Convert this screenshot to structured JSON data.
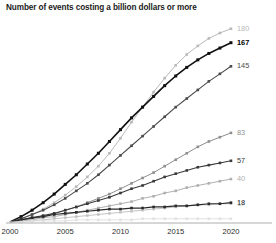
{
  "chart_data": {
    "type": "line",
    "title": "Number of events costing a billion dollars or more",
    "xlabel": "",
    "ylabel": "",
    "xlim": [
      2000,
      2021
    ],
    "ylim": [
      0,
      190
    ],
    "grid": false,
    "legend": "end-of-line labels",
    "x": [
      2000,
      2001,
      2002,
      2003,
      2004,
      2005,
      2006,
      2007,
      2008,
      2009,
      2010,
      2011,
      2012,
      2013,
      2014,
      2015,
      2016,
      2017,
      2018,
      2019,
      2020
    ],
    "xtick_labels": [
      "2000",
      "2005",
      "2010",
      "2015",
      "2020"
    ],
    "xticks": [
      2000,
      2005,
      2010,
      2015,
      2020
    ],
    "series": [
      {
        "name": "180",
        "end_label": "180",
        "end_value": 180,
        "color": "#b9b9b9",
        "line_width": 1.0,
        "marker": "square",
        "emphasis": false,
        "values": [
          0,
          3,
          7,
          12,
          18,
          25,
          33,
          42,
          52,
          64,
          78,
          93,
          107,
          121,
          134,
          146,
          156,
          164,
          171,
          176,
          180
        ]
      },
      {
        "name": "167",
        "end_label": "167",
        "end_value": 167,
        "color": "#111111",
        "line_width": 1.6,
        "marker": "square",
        "emphasis": true,
        "values": [
          0,
          5,
          11,
          18,
          26,
          35,
          44,
          54,
          64,
          75,
          86,
          97,
          107,
          117,
          127,
          136,
          144,
          151,
          157,
          162,
          167
        ]
      },
      {
        "name": "145",
        "end_label": "145",
        "end_value": 145,
        "color": "#4a4a4a",
        "line_width": 1.1,
        "marker": "square",
        "emphasis": false,
        "values": [
          0,
          3,
          7,
          11,
          16,
          22,
          29,
          36,
          44,
          53,
          62,
          71,
          80,
          89,
          98,
          107,
          115,
          123,
          131,
          138,
          145
        ]
      },
      {
        "name": "83",
        "end_label": "83",
        "end_value": 83,
        "color": "#8f8f8f",
        "line_width": 1.0,
        "marker": "square",
        "emphasis": false,
        "values": [
          0,
          1,
          3,
          5,
          8,
          11,
          14,
          18,
          22,
          26,
          31,
          36,
          41,
          46,
          52,
          58,
          64,
          70,
          75,
          79,
          83
        ]
      },
      {
        "name": "57",
        "end_label": "57",
        "end_value": 57,
        "color": "#3a3a3a",
        "line_width": 1.1,
        "marker": "square",
        "emphasis": false,
        "values": [
          0,
          2,
          4,
          6,
          8,
          11,
          14,
          17,
          20,
          23,
          27,
          31,
          34,
          38,
          42,
          45,
          48,
          51,
          53,
          55,
          57
        ]
      },
      {
        "name": "40",
        "end_label": "40",
        "end_value": 40,
        "color": "#b0b0b0",
        "line_width": 1.0,
        "marker": "square",
        "emphasis": false,
        "values": [
          0,
          1,
          2,
          4,
          5,
          7,
          9,
          11,
          13,
          15,
          17,
          19,
          22,
          24,
          27,
          29,
          32,
          34,
          36,
          38,
          40
        ]
      },
      {
        "name": "17",
        "end_label": "17",
        "end_value": 17,
        "color": "#c4c4c4",
        "line_width": 1.0,
        "marker": "square",
        "emphasis": false,
        "values": [
          0,
          1,
          1,
          2,
          3,
          4,
          5,
          6,
          7,
          8,
          9,
          10,
          11,
          12,
          13,
          14,
          15,
          16,
          16,
          17,
          17
        ]
      },
      {
        "name": "18",
        "end_label": "18",
        "end_value": 18,
        "color": "#2b2b2b",
        "line_width": 1.2,
        "marker": "square",
        "emphasis": false,
        "values": [
          0,
          2,
          4,
          5,
          7,
          8,
          9,
          10,
          11,
          12,
          12,
          13,
          13,
          14,
          14,
          15,
          15,
          16,
          17,
          17,
          18
        ]
      },
      {
        "name": "baseline-faint",
        "end_label": "",
        "end_value": 3,
        "color": "#e2e2e2",
        "line_width": 1.0,
        "marker": "square",
        "emphasis": false,
        "values": [
          0,
          0,
          1,
          1,
          1,
          1,
          2,
          2,
          2,
          2,
          2,
          2,
          3,
          3,
          3,
          3,
          3,
          3,
          3,
          3,
          3
        ]
      }
    ]
  }
}
